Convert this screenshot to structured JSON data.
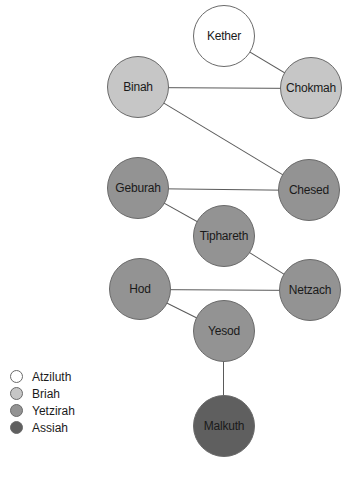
{
  "diagram": {
    "worlds": {
      "atziluth": {
        "label": "Atziluth",
        "color": "#ffffff"
      },
      "briah": {
        "label": "Briah",
        "color": "#c6c6c6"
      },
      "yetzirah": {
        "label": "Yetzirah",
        "color": "#939393"
      },
      "assiah": {
        "label": "Assiah",
        "color": "#5f5f5f"
      }
    },
    "nodes": [
      {
        "id": "kether",
        "label": "Kether",
        "world": "atziluth",
        "x": 224,
        "y": 36
      },
      {
        "id": "binah",
        "label": "Binah",
        "world": "briah",
        "x": 138,
        "y": 87
      },
      {
        "id": "chokmah",
        "label": "Chokmah",
        "world": "briah",
        "x": 311,
        "y": 88
      },
      {
        "id": "geburah",
        "label": "Geburah",
        "world": "yetzirah",
        "x": 138,
        "y": 188
      },
      {
        "id": "chesed",
        "label": "Chesed",
        "world": "yetzirah",
        "x": 309,
        "y": 190
      },
      {
        "id": "tiphareth",
        "label": "Tiphareth",
        "world": "yetzirah",
        "x": 224,
        "y": 236
      },
      {
        "id": "hod",
        "label": "Hod",
        "world": "yetzirah",
        "x": 140,
        "y": 289
      },
      {
        "id": "netzach",
        "label": "Netzach",
        "world": "yetzirah",
        "x": 310,
        "y": 290
      },
      {
        "id": "yesod",
        "label": "Yesod",
        "world": "yetzirah",
        "x": 224,
        "y": 331
      },
      {
        "id": "malkuth",
        "label": "Malkuth",
        "world": "assiah",
        "x": 224,
        "y": 426
      }
    ],
    "edges": [
      [
        "kether",
        "chokmah"
      ],
      [
        "binah",
        "chokmah"
      ],
      [
        "binah",
        "chesed"
      ],
      [
        "geburah",
        "chesed"
      ],
      [
        "geburah",
        "tiphareth"
      ],
      [
        "tiphareth",
        "netzach"
      ],
      [
        "hod",
        "netzach"
      ],
      [
        "hod",
        "yesod"
      ],
      [
        "yesod",
        "malkuth"
      ]
    ],
    "legend": [
      {
        "label": "Atziluth",
        "world": "atziluth"
      },
      {
        "label": "Briah",
        "world": "briah"
      },
      {
        "label": "Yetzirah",
        "world": "yetzirah"
      },
      {
        "label": "Assiah",
        "world": "assiah"
      }
    ]
  }
}
